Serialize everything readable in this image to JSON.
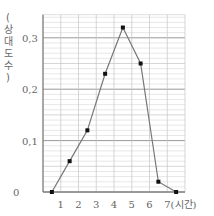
{
  "chart_data": {
    "type": "line",
    "title": "",
    "xlabel": "(시간)",
    "ylabel": "(상대도수)",
    "x": [
      0.5,
      1.5,
      2.5,
      3.5,
      4.5,
      5.5,
      6.5,
      7.5
    ],
    "values": [
      0,
      0.06,
      0.12,
      0.23,
      0.32,
      0.25,
      0.02,
      0
    ],
    "x_ticks": [
      "1",
      "2",
      "3",
      "4",
      "5",
      "6",
      "7"
    ],
    "y_ticks": [
      "0",
      "0,1",
      "0,2",
      "0,3"
    ],
    "xlim": [
      0,
      8
    ],
    "ylim": [
      0,
      0.345
    ],
    "grid": true,
    "legend": null
  },
  "labels": {
    "ylabel_chars": [
      "(",
      "상",
      "대",
      "도",
      "수",
      ")"
    ],
    "xlabel": "7(시간)"
  }
}
